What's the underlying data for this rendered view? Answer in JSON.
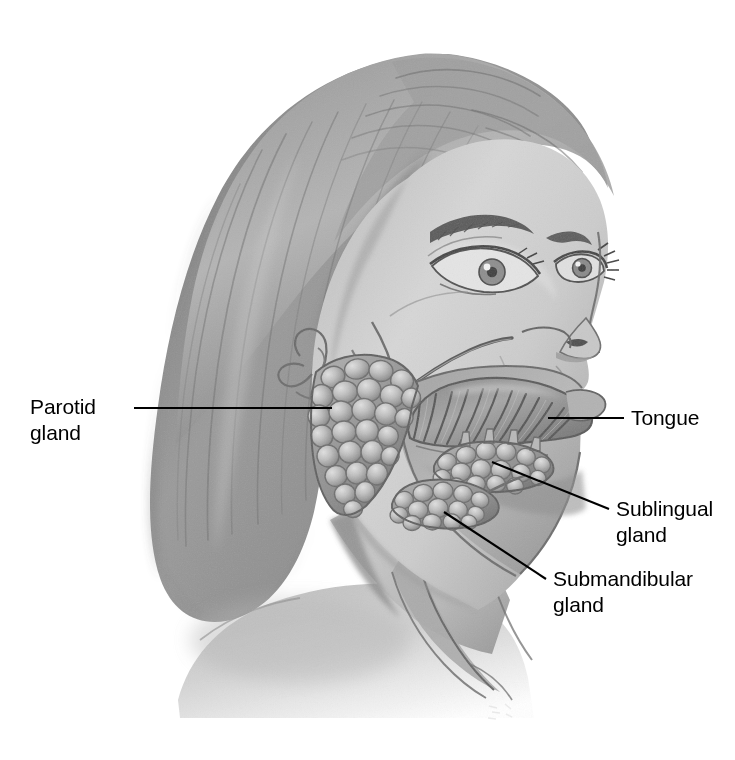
{
  "figure": {
    "view": "lateral three-quarter view of female head and neck",
    "background_color": "#ffffff",
    "line_color": "#000000",
    "palette": {
      "hair_light": "#b9b9b9",
      "hair_mid": "#8d8d8d",
      "hair_dark": "#6a6a6a",
      "hair_shadow": "#575757",
      "skin_light": "#d8d8d8",
      "skin_mid": "#c2c2c2",
      "skin_shadow": "#a2a2a2",
      "gland_light": "#cfcfcf",
      "gland_mid": "#a8a8a8",
      "gland_dark": "#7c7c7c",
      "tongue_mid": "#9a9a9a",
      "tongue_dark": "#5e5e5e",
      "outline": "#4a4a4a"
    }
  },
  "labels": [
    {
      "id": "parotid",
      "lines": [
        "Parotid",
        "gland"
      ],
      "side": "left",
      "text_x": 30,
      "text_y": 414,
      "anchor": "start",
      "leader": "M 134 408 L 332 408"
    },
    {
      "id": "tongue",
      "lines": [
        "Tongue"
      ],
      "side": "right",
      "text_x": 631,
      "text_y": 425,
      "anchor": "start",
      "leader": "M 548 418 L 624 418"
    },
    {
      "id": "sublingual",
      "lines": [
        "Sublingual",
        "gland"
      ],
      "side": "right",
      "text_x": 616,
      "text_y": 516,
      "anchor": "start",
      "leader": "M 492 462 L 609 509"
    },
    {
      "id": "submandibular",
      "lines": [
        "Submandibular",
        "gland"
      ],
      "side": "right",
      "text_x": 553,
      "text_y": 586,
      "anchor": "start",
      "leader": "M 444 512 L 546 579"
    }
  ],
  "structures": [
    {
      "id": "hair",
      "name": "hair"
    },
    {
      "id": "face",
      "name": "face-and-neck-skin"
    },
    {
      "id": "ear",
      "name": "ear"
    },
    {
      "id": "eye-near",
      "name": "near-eye"
    },
    {
      "id": "eye-far",
      "name": "far-eye"
    },
    {
      "id": "nose",
      "name": "nose"
    },
    {
      "id": "lips",
      "name": "lips"
    },
    {
      "id": "parotid-gland",
      "name": "parotid-gland"
    },
    {
      "id": "parotid-duct",
      "name": "parotid-duct"
    },
    {
      "id": "tongue-body",
      "name": "tongue"
    },
    {
      "id": "sublingual-gland",
      "name": "sublingual-gland"
    },
    {
      "id": "submandibular-gland",
      "name": "submandibular-gland"
    },
    {
      "id": "mandible-cutaway",
      "name": "mandible-cutaway"
    },
    {
      "id": "neck-muscle",
      "name": "sternocleidomastoid-muscle"
    },
    {
      "id": "shoulder",
      "name": "shoulder"
    }
  ]
}
